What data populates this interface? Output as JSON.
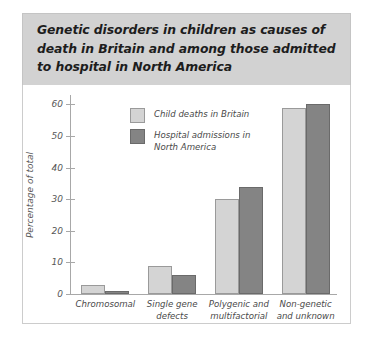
{
  "title": "Genetic disorders in children as causes of\ndeath in Britain and among those admitted\nto hospital in North America",
  "colors": {
    "series_light": "#d4d4d4",
    "series_dark": "#848484",
    "title_band": "#d2d2d2",
    "axis": "#a8a8a8",
    "text": "#4a4a4a"
  },
  "chart_data": {
    "type": "bar",
    "title": "Genetic disorders in children as causes of death in Britain and among those admitted to hospital in North America",
    "xlabel": "",
    "ylabel": "Percentage of total",
    "ylim": [
      0,
      63
    ],
    "yticks": [
      0,
      10,
      20,
      30,
      40,
      50,
      60
    ],
    "ytick_labels": [
      "0",
      "10",
      "20",
      "30",
      "40",
      "50",
      "60"
    ],
    "grid": false,
    "legend_position": "upper-left-inside",
    "categories": [
      "Chromosomal",
      "Single gene\ndefects",
      "Polygenic and\nmultifactorial",
      "Non-genetic\nand unknown"
    ],
    "series": [
      {
        "name": "Child deaths in Britain",
        "color": "#d4d4d4",
        "values": [
          3,
          9,
          30,
          59
        ]
      },
      {
        "name": "Hospital admissions in\nNorth America",
        "color": "#848484",
        "values": [
          1,
          6,
          34,
          60
        ]
      }
    ]
  }
}
